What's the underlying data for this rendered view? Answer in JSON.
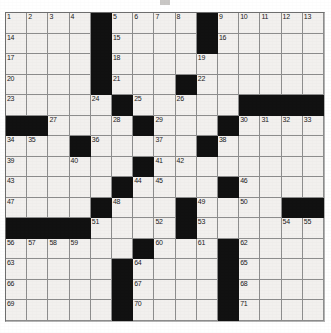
{
  "puzzle": {
    "kind": "crossword-grid",
    "columns": 15,
    "rows": 15,
    "cell_background": "#f2f0ee",
    "block_color": "#111111",
    "grid_line_color": "#8d8d8d",
    "number_color": "#1a1a1a",
    "total_clue_numbers": 71,
    "cells": [
      [
        {
          "n": "1"
        },
        {
          "n": "2"
        },
        {
          "n": "3"
        },
        {
          "n": "4"
        },
        {
          "b": true
        },
        {
          "n": "5"
        },
        {
          "n": "6"
        },
        {
          "n": "7"
        },
        {
          "n": "8"
        },
        {
          "b": true
        },
        {
          "n": "9"
        },
        {
          "n": "10"
        },
        {
          "n": "11"
        },
        {
          "n": "12"
        },
        {
          "n": "13"
        }
      ],
      [
        {
          "n": "14"
        },
        {},
        {},
        {},
        {
          "b": true
        },
        {
          "n": "15"
        },
        {},
        {},
        {},
        {
          "b": true
        },
        {
          "n": "16"
        },
        {},
        {},
        {},
        {}
      ],
      [
        {
          "n": "17"
        },
        {},
        {},
        {},
        {
          "b": true
        },
        {
          "n": "18"
        },
        {},
        {},
        {},
        {
          "n": "19"
        },
        {},
        {},
        {},
        {},
        {}
      ],
      [
        {
          "n": "20"
        },
        {},
        {},
        {},
        {
          "b": true
        },
        {
          "n": "21"
        },
        {},
        {},
        {
          "b": true
        },
        {
          "n": "22"
        },
        {},
        {},
        {},
        {},
        {}
      ],
      [
        {
          "n": "23"
        },
        {},
        {},
        {},
        {
          "n": "24"
        },
        {
          "b": true
        },
        {
          "n": "25"
        },
        {},
        {
          "n": "26"
        },
        {},
        {},
        {
          "b": true
        },
        {
          "b": true
        },
        {
          "b": true
        },
        {
          "b": true
        }
      ],
      [
        {
          "b": true
        },
        {
          "b": true
        },
        {
          "n": "27"
        },
        {},
        {},
        {
          "n": "28"
        },
        {
          "b": true
        },
        {
          "n": "29"
        },
        {},
        {},
        {
          "b": true
        },
        {
          "n": "30"
        },
        {
          "n": "31"
        },
        {
          "n": "32"
        },
        {
          "n": "33"
        }
      ],
      [
        {
          "n": "34"
        },
        {
          "n": "35"
        },
        {},
        {
          "b": true
        },
        {
          "n": "36"
        },
        {},
        {},
        {
          "n": "37"
        },
        {},
        {
          "b": true
        },
        {
          "n": "38"
        },
        {},
        {},
        {},
        {}
      ],
      [
        {
          "n": "39"
        },
        {},
        {},
        {
          "n": "40"
        },
        {},
        {},
        {
          "b": true
        },
        {
          "n": "41"
        },
        {
          "n": "42"
        },
        {},
        {},
        {},
        {},
        {},
        {}
      ],
      [
        {
          "n": "43"
        },
        {},
        {},
        {},
        {},
        {
          "b": true
        },
        {
          "n": "44"
        },
        {
          "n": "45"
        },
        {},
        {},
        {
          "b": true
        },
        {
          "n": "46"
        },
        {},
        {},
        {}
      ],
      [
        {
          "n": "47"
        },
        {},
        {},
        {},
        {
          "b": true
        },
        {
          "n": "48"
        },
        {},
        {},
        {
          "b": true
        },
        {
          "n": "49"
        },
        {},
        {
          "n": "50"
        },
        {},
        {
          "b": true
        },
        {
          "b": true
        }
      ],
      [
        {
          "b": true
        },
        {
          "b": true
        },
        {
          "b": true
        },
        {
          "b": true
        },
        {
          "n": "51"
        },
        {},
        {},
        {
          "n": "52"
        },
        {
          "b": true
        },
        {
          "n": "53"
        },
        {},
        {},
        {},
        {
          "n": "54"
        },
        {
          "n": "55"
        }
      ],
      [
        {
          "n": "56"
        },
        {
          "n": "57"
        },
        {
          "n": "58"
        },
        {
          "n": "59"
        },
        {},
        {},
        {
          "b": true
        },
        {
          "n": "60"
        },
        {},
        {
          "n": "61"
        },
        {
          "b": true
        },
        {
          "n": "62"
        },
        {},
        {},
        {}
      ],
      [
        {
          "n": "63"
        },
        {},
        {},
        {},
        {},
        {
          "b": true
        },
        {
          "n": "64"
        },
        {},
        {},
        {},
        {
          "b": true
        },
        {
          "n": "65"
        },
        {},
        {},
        {}
      ],
      [
        {
          "n": "66"
        },
        {},
        {},
        {},
        {},
        {
          "b": true
        },
        {
          "n": "67"
        },
        {},
        {},
        {},
        {
          "b": true
        },
        {
          "n": "68"
        },
        {},
        {},
        {}
      ],
      [
        {
          "n": "69"
        },
        {},
        {},
        {},
        {},
        {
          "b": true
        },
        {
          "n": "70"
        },
        {},
        {},
        {},
        {
          "b": true
        },
        {
          "n": "71"
        },
        {},
        {},
        {}
      ]
    ]
  }
}
